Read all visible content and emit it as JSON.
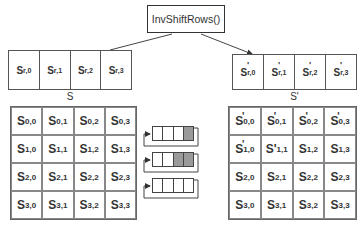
{
  "title": "InvShiftRows()",
  "row_input": {
    "label": "S",
    "cells": [
      {
        "base": "S",
        "sub": "r,0"
      },
      {
        "base": "S",
        "sub": "r,1"
      },
      {
        "base": "S",
        "sub": "r,2"
      },
      {
        "base": "S",
        "sub": "r,3"
      }
    ]
  },
  "row_output": {
    "label": "S'",
    "cells": [
      {
        "prime": "'",
        "base": "S",
        "sub": "r,0"
      },
      {
        "prime": "'",
        "base": "S",
        "sub": "r,1"
      },
      {
        "prime": "'",
        "base": "S",
        "sub": "r,2"
      },
      {
        "prime": "'",
        "base": "S",
        "sub": "r,3"
      }
    ]
  },
  "state_input": {
    "cells": [
      [
        {
          "base": "S",
          "sub": "0,0"
        },
        {
          "base": "S",
          "sub": "0,1"
        },
        {
          "base": "S",
          "sub": "0,2"
        },
        {
          "base": "S",
          "sub": "0,3"
        }
      ],
      [
        {
          "base": "S",
          "sub": "1,0"
        },
        {
          "base": "S",
          "sub": "1,1"
        },
        {
          "base": "S",
          "sub": "1,2"
        },
        {
          "base": "S",
          "sub": "1,3"
        }
      ],
      [
        {
          "base": "S",
          "sub": "2,0"
        },
        {
          "base": "S",
          "sub": "2,1"
        },
        {
          "base": "S",
          "sub": "2,2"
        },
        {
          "base": "S",
          "sub": "2,3"
        }
      ],
      [
        {
          "base": "S",
          "sub": "3,0"
        },
        {
          "base": "S",
          "sub": "3,1"
        },
        {
          "base": "S",
          "sub": "3,2"
        },
        {
          "base": "S",
          "sub": "3,3"
        }
      ]
    ]
  },
  "state_output": {
    "cells": [
      [
        {
          "prime": "'",
          "base": "S",
          "sub": "0,0"
        },
        {
          "prime": "'",
          "base": "S",
          "sub": "0,1"
        },
        {
          "prime": "'",
          "base": "S",
          "sub": "0,2"
        },
        {
          "prime": "'",
          "base": "S",
          "sub": "0,3"
        }
      ],
      [
        {
          "prime": "'",
          "base": "S",
          "sub": "1,0"
        },
        {
          "base": "S'",
          "sub": "1,1"
        },
        {
          "base": "S",
          "sub": "1,2"
        },
        {
          "base": "S",
          "sub": "1,3"
        }
      ],
      [
        {
          "base": "S",
          "sub": "2,0"
        },
        {
          "base": "S",
          "sub": "2,1"
        },
        {
          "base": "S",
          "sub": "2,2"
        },
        {
          "base": "S",
          "sub": "2,3"
        }
      ],
      [
        {
          "base": "S",
          "sub": "3,0"
        },
        {
          "base": "S",
          "sub": "3,1"
        },
        {
          "base": "S",
          "sub": "3,2"
        },
        {
          "base": "S",
          "sub": "3,3"
        }
      ]
    ]
  },
  "shift_registers": [
    {
      "shaded": [
        false,
        false,
        false,
        true
      ]
    },
    {
      "shaded": [
        false,
        false,
        true,
        true
      ]
    },
    {
      "shaded": [
        false,
        false,
        false,
        false
      ]
    }
  ],
  "colors": {
    "shaded": "#9a9a9a",
    "line": "#444444"
  }
}
